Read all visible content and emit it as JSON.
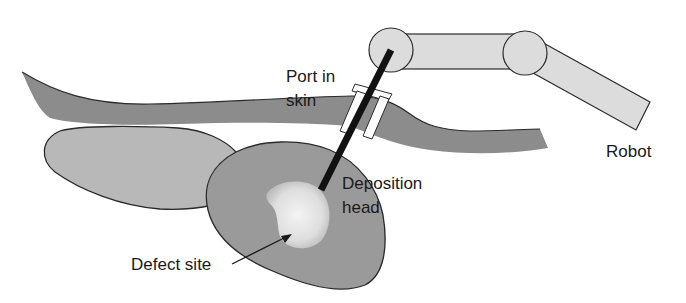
{
  "diagram": {
    "title": "",
    "labels": {
      "port": [
        "Port in",
        "skin"
      ],
      "robot": "Robot",
      "deposition": [
        "Deposition",
        "head"
      ],
      "defect": "Defect site"
    },
    "components": [
      "skin layer",
      "organ",
      "tissue region",
      "defect site",
      "deposition head",
      "port",
      "robot arm"
    ],
    "colors": {
      "skin": "#8c8c8c",
      "organ": "#b8b8b8",
      "tissue": "#9a9a9a",
      "defect_center": "#f2f2f2",
      "robot": "#dcdcdc",
      "outline": "#2a2a2a",
      "tool": "#111111"
    }
  }
}
